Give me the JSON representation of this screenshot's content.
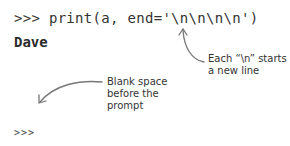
{
  "console": {
    "line1": ">>> print(a, end='\\n\\n\\n\\n')",
    "output": "Dave",
    "prompt": ">>>"
  },
  "annotations": [
    {
      "line1": "Each “\\n” starts",
      "line2": "a new line"
    },
    {
      "line1": "Blank space",
      "line2": "before the",
      "line3": "prompt"
    }
  ],
  "colors": {
    "text": "#333333",
    "arrow": "#777777",
    "background": "#ffffff"
  }
}
